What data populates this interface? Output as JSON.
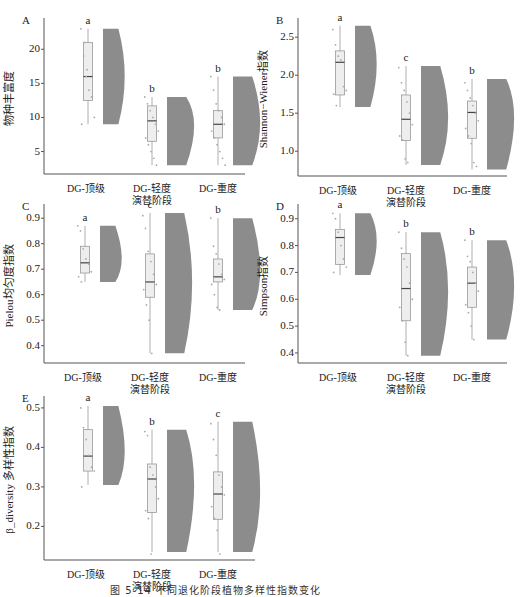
{
  "figure": {
    "caption_partial": "图 5-14  不同退化阶段植物多样性指数变化"
  },
  "chart_data": [
    {
      "type": "raincloud",
      "panel": "A",
      "ylabel": "物种丰富度",
      "xtitle": "演替阶段",
      "categories": [
        "DG-顶级",
        "DG-轻度",
        "DG-重度"
      ],
      "yticks": [
        5,
        10,
        15,
        20
      ],
      "ylim": [
        2,
        24
      ],
      "box": [
        {
          "min": 9,
          "q1": 12.5,
          "median": 16,
          "q3": 21,
          "max": 23
        },
        {
          "min": 3,
          "q1": 6.5,
          "median": 9.5,
          "q3": 11.7,
          "max": 13
        },
        {
          "min": 3,
          "q1": 7,
          "median": 9,
          "q3": 11,
          "max": 16
        }
      ],
      "significance": [
        "a",
        "b",
        "b"
      ],
      "points": [
        [
          23,
          19,
          16,
          14,
          13,
          10,
          9,
          21,
          17
        ],
        [
          13,
          12,
          11,
          10,
          9,
          8,
          7,
          6,
          5,
          4,
          3
        ],
        [
          16,
          14,
          12,
          11,
          10,
          9,
          8,
          7,
          6,
          5,
          4,
          3
        ]
      ]
    },
    {
      "type": "raincloud",
      "panel": "B",
      "ylabel": "Shannon−Wiener指数",
      "xtitle": "演替阶段",
      "categories": [
        "DG-顶级",
        "DG-轻度",
        "DG-重度"
      ],
      "yticks": [
        1.0,
        1.5,
        2.0,
        2.5
      ],
      "ylim": [
        0.7,
        2.7
      ],
      "box": [
        {
          "min": 1.58,
          "q1": 1.74,
          "median": 2.17,
          "q3": 2.32,
          "max": 2.65
        },
        {
          "min": 0.82,
          "q1": 1.14,
          "median": 1.42,
          "q3": 1.74,
          "max": 2.12
        },
        {
          "min": 0.76,
          "q1": 1.17,
          "median": 1.51,
          "q3": 1.66,
          "max": 1.95
        }
      ],
      "significance": [
        "a",
        "c",
        "b"
      ],
      "points": [
        [
          2.6,
          2.4,
          2.25,
          2.2,
          1.85,
          1.8,
          1.75,
          1.6
        ],
        [
          2.1,
          1.9,
          1.8,
          1.65,
          1.5,
          1.35,
          1.2,
          1.15,
          0.9,
          0.85
        ],
        [
          1.9,
          1.8,
          1.7,
          1.6,
          1.5,
          1.4,
          1.3,
          1.2,
          1.1,
          0.85,
          0.8
        ]
      ]
    },
    {
      "type": "raincloud",
      "panel": "C",
      "ylabel": "Pielou均匀度指数",
      "xtitle": "演替阶段",
      "categories": [
        "DG-顶级",
        "DG-轻度",
        "DG-重度"
      ],
      "yticks": [
        0.4,
        0.5,
        0.6,
        0.7,
        0.8,
        0.9
      ],
      "ylim": [
        0.34,
        0.94
      ],
      "box": [
        {
          "min": 0.65,
          "q1": 0.685,
          "median": 0.725,
          "q3": 0.79,
          "max": 0.87
        },
        {
          "min": 0.37,
          "q1": 0.59,
          "median": 0.65,
          "q3": 0.76,
          "max": 0.92
        },
        {
          "min": 0.54,
          "q1": 0.65,
          "median": 0.67,
          "q3": 0.74,
          "max": 0.9
        }
      ],
      "significance": [
        "a",
        "c",
        "b"
      ],
      "points": [
        [
          0.87,
          0.85,
          0.78,
          0.74,
          0.72,
          0.69,
          0.67,
          0.65
        ],
        [
          0.91,
          0.86,
          0.77,
          0.73,
          0.68,
          0.64,
          0.62,
          0.56,
          0.5,
          0.37
        ],
        [
          0.9,
          0.79,
          0.76,
          0.72,
          0.68,
          0.66,
          0.64,
          0.6,
          0.55,
          0.54
        ]
      ]
    },
    {
      "type": "raincloud",
      "panel": "D",
      "ylabel": "Simpson指数",
      "xtitle": "演替阶段",
      "categories": [
        "DG-顶级",
        "DG-轻度",
        "DG-重度"
      ],
      "yticks": [
        0.4,
        0.5,
        0.6,
        0.7,
        0.8,
        0.9
      ],
      "ylim": [
        0.37,
        0.94
      ],
      "box": [
        {
          "min": 0.69,
          "q1": 0.73,
          "median": 0.83,
          "q3": 0.86,
          "max": 0.92
        },
        {
          "min": 0.39,
          "q1": 0.52,
          "median": 0.64,
          "q3": 0.77,
          "max": 0.85
        },
        {
          "min": 0.45,
          "q1": 0.57,
          "median": 0.66,
          "q3": 0.72,
          "max": 0.82
        }
      ],
      "significance": [
        "a",
        "b",
        "b"
      ],
      "points": [
        [
          0.92,
          0.9,
          0.85,
          0.8,
          0.75,
          0.72,
          0.7
        ],
        [
          0.85,
          0.79,
          0.75,
          0.72,
          0.66,
          0.6,
          0.57,
          0.52,
          0.44,
          0.39
        ],
        [
          0.82,
          0.76,
          0.74,
          0.7,
          0.66,
          0.63,
          0.58,
          0.55,
          0.5,
          0.45
        ]
      ]
    },
    {
      "type": "raincloud",
      "panel": "E",
      "ylabel": "β_diversity 多样性指数",
      "xtitle": "演替阶段",
      "categories": [
        "DG-顶级",
        "DG-轻度",
        "DG-重度"
      ],
      "yticks": [
        0.2,
        0.3,
        0.4,
        0.5
      ],
      "ylim": [
        0.12,
        0.52
      ],
      "box": [
        {
          "min": 0.305,
          "q1": 0.34,
          "median": 0.378,
          "q3": 0.445,
          "max": 0.505
        },
        {
          "min": 0.135,
          "q1": 0.235,
          "median": 0.32,
          "q3": 0.358,
          "max": 0.445
        },
        {
          "min": 0.135,
          "q1": 0.218,
          "median": 0.282,
          "q3": 0.338,
          "max": 0.465
        }
      ],
      "significance": [
        "a",
        "b",
        "c"
      ],
      "points": [
        [
          0.5,
          0.45,
          0.42,
          0.38,
          0.35,
          0.34,
          0.3
        ],
        [
          0.44,
          0.43,
          0.35,
          0.33,
          0.3,
          0.27,
          0.24,
          0.22,
          0.13
        ],
        [
          0.46,
          0.42,
          0.38,
          0.33,
          0.3,
          0.28,
          0.25,
          0.22,
          0.19,
          0.13
        ]
      ]
    }
  ]
}
